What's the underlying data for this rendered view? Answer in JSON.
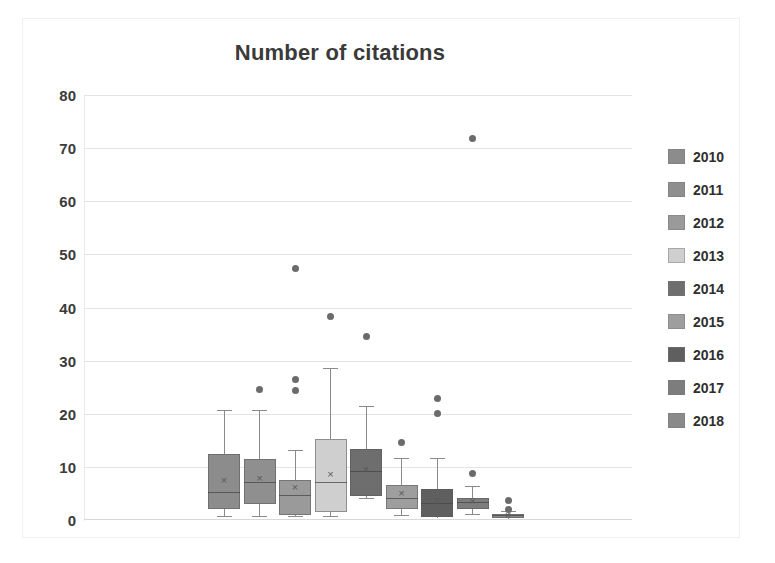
{
  "chart": {
    "title": "Number of citations",
    "legend_position": "right"
  },
  "legend": {
    "items": [
      {
        "label": "2010",
        "color": "#8c8c8c"
      },
      {
        "label": "2011",
        "color": "#8f8f8f"
      },
      {
        "label": "2012",
        "color": "#9a9a9a"
      },
      {
        "label": "2013",
        "color": "#cfcfcf"
      },
      {
        "label": "2014",
        "color": "#6e6e6e"
      },
      {
        "label": "2015",
        "color": "#9e9e9e"
      },
      {
        "label": "2016",
        "color": "#5f5f5f"
      },
      {
        "label": "2017",
        "color": "#7d7d7d"
      },
      {
        "label": "2018",
        "color": "#8a8a8a"
      }
    ]
  },
  "yaxis": {
    "ticks": [
      "80",
      "70",
      "60",
      "50",
      "40",
      "30",
      "20",
      "10",
      "0"
    ],
    "min": 0,
    "max": 80,
    "step": 10
  },
  "chart_data": {
    "type": "box",
    "title": "Number of citations",
    "xlabel": "",
    "ylabel": "",
    "ylim": [
      0,
      80
    ],
    "ytick_step": 10,
    "grid": true,
    "legend_position": "right",
    "categories": [
      "2010",
      "2011",
      "2012",
      "2013",
      "2014",
      "2015",
      "2016",
      "2017",
      "2018"
    ],
    "series": [
      {
        "name": "2010",
        "color": "#8c8c8c",
        "min": 0.5,
        "q1": 2.0,
        "median": 5.0,
        "mean": 7.5,
        "q3": 12.5,
        "max": 20.5,
        "outliers": []
      },
      {
        "name": "2011",
        "color": "#8f8f8f",
        "min": 0.5,
        "q1": 3.0,
        "median": 7.0,
        "mean": 7.8,
        "q3": 11.5,
        "max": 20.5,
        "outliers": [
          24.5
        ]
      },
      {
        "name": "2012",
        "color": "#9a9a9a",
        "min": 0.5,
        "q1": 1.0,
        "median": 4.5,
        "mean": 6.2,
        "q3": 7.5,
        "max": 13.0,
        "outliers": [
          26.5,
          24.3,
          47.3
        ]
      },
      {
        "name": "2013",
        "color": "#cfcfcf",
        "min": 0.5,
        "q1": 1.5,
        "median": 7.0,
        "mean": 8.5,
        "q3": 15.3,
        "max": 28.5,
        "outliers": [
          38.3
        ]
      },
      {
        "name": "2014",
        "color": "#6e6e6e",
        "min": 4.0,
        "q1": 4.5,
        "median": 9.0,
        "mean": 9.6,
        "q3": 13.3,
        "max": 21.3,
        "outliers": [
          34.6
        ]
      },
      {
        "name": "2015",
        "color": "#9e9e9e",
        "min": 0.8,
        "q1": 2.0,
        "median": 4.0,
        "mean": 5.0,
        "q3": 6.5,
        "max": 11.5,
        "outliers": [
          14.6
        ]
      },
      {
        "name": "2016",
        "color": "#5f5f5f",
        "min": 0.5,
        "q1": 0.6,
        "median": 3.0,
        "mean": 3.6,
        "q3": 5.8,
        "max": 11.5,
        "outliers": [
          22.8,
          20.0
        ]
      },
      {
        "name": "2017",
        "color": "#7d7d7d",
        "min": 1.0,
        "q1": 2.0,
        "median": 3.2,
        "mean": 3.4,
        "q3": 4.2,
        "max": 6.2,
        "outliers": [
          8.8,
          71.8
        ]
      },
      {
        "name": "2018",
        "color": "#8a8a8a",
        "min": 0.3,
        "q1": 0.4,
        "median": 0.7,
        "mean": 0.9,
        "q3": 1.1,
        "max": 1.6,
        "outliers": [
          3.6,
          2.0
        ]
      }
    ]
  }
}
